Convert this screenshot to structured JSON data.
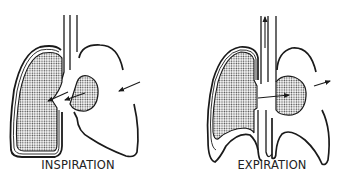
{
  "figure": {
    "panels": [
      {
        "id": "inspiration",
        "label": "INSPIRATION",
        "description": "Left lung expanded (shaded), air drawn in via trachea; arrows pointing inward toward lung and mediastinum"
      },
      {
        "id": "expiration",
        "label": "EXPIRATION",
        "description": "Lung deflating, air leaving via trachea (upward arrow); arrows pointing outward"
      }
    ],
    "colors": {
      "stroke": "#1a1a1a",
      "shading_dots": "#333333",
      "background": "#ffffff"
    },
    "icons": [
      "trachea-tube",
      "left-lung-shaded",
      "right-lung-outline",
      "mediastinum-bubble",
      "arrow-inward",
      "arrow-upward",
      "arrow-outward"
    ]
  }
}
